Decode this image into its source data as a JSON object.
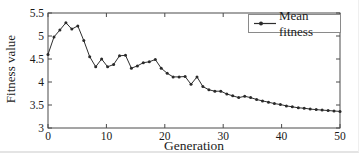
{
  "chart_data": {
    "type": "line",
    "title": "",
    "xlabel": "Generation",
    "ylabel": "Fitness value",
    "legend_label": "Mean fitness",
    "legend_position": "top-right-inside",
    "xlim": [
      0,
      50
    ],
    "ylim": [
      3,
      5.5
    ],
    "xticks": [
      0,
      10,
      20,
      30,
      40,
      50
    ],
    "yticks": [
      3,
      3.5,
      4,
      4.5,
      5,
      5.5
    ],
    "grid": false,
    "box": true,
    "marker": "dot",
    "series": [
      {
        "name": "Mean fitness",
        "values": [
          4.6,
          4.98,
          5.13,
          5.29,
          5.15,
          5.22,
          4.9,
          4.55,
          4.33,
          4.5,
          4.33,
          4.38,
          4.57,
          4.58,
          4.3,
          4.35,
          4.42,
          4.44,
          4.49,
          4.3,
          4.19,
          4.11,
          4.11,
          4.12,
          3.95,
          4.11,
          3.9,
          3.83,
          3.8,
          3.8,
          3.74,
          3.7,
          3.66,
          3.69,
          3.66,
          3.62,
          3.59,
          3.56,
          3.53,
          3.51,
          3.48,
          3.46,
          3.44,
          3.43,
          3.41,
          3.4,
          3.39,
          3.38,
          3.37,
          3.36
        ]
      }
    ],
    "colors": {
      "line": "#2e2e2e",
      "marker": "#2a2a2a",
      "axis": "#4a4a4a",
      "text": "#1a1a1a",
      "background": "#ffffff",
      "legend_border": "#8a8a8a"
    }
  }
}
